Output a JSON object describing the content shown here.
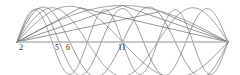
{
  "figure": {
    "title": "",
    "background_color": "#ffffff",
    "width": 240,
    "height": 75
  },
  "axis": {
    "name": "horizontal-axis",
    "color": "#c8c8c8",
    "stroke_width": 1.2,
    "x_start": 17,
    "x_end": 228,
    "y": 42
  },
  "labels": [
    {
      "id": "label-2",
      "text": "2",
      "x": 19,
      "y": 44
    },
    {
      "id": "label-5",
      "text": "5",
      "x": 55,
      "y": 44
    },
    {
      "id": "label-6",
      "text": "6",
      "x": 66,
      "y": 44
    },
    {
      "id": "label-11",
      "text": "11",
      "x": 118,
      "y": 44
    }
  ],
  "chart_data": {
    "type": "line",
    "title": "",
    "xlabel": "",
    "ylabel": "",
    "xlim": [
      0,
      1
    ],
    "ylim": [
      -1,
      1
    ],
    "grid": false,
    "legend": false,
    "axis_line": "horizontal zero axis, light gray",
    "x_samples": 400,
    "series": [
      {
        "name": "mode-1",
        "mode": 1,
        "amplitude": 0.96,
        "phase": 0.0,
        "color": "#6e6e6e",
        "stroke_width": 0.7
      },
      {
        "name": "mode-2",
        "mode": 2,
        "amplitude": 0.94,
        "phase": 0.0,
        "color": "#6a6a6a",
        "stroke_width": 0.7
      },
      {
        "name": "mode-3",
        "mode": 3,
        "amplitude": 0.9,
        "phase": 0.0,
        "color": "#707070",
        "stroke_width": 0.7
      },
      {
        "name": "mode-4",
        "mode": 4,
        "amplitude": 0.92,
        "phase": 0.0,
        "color": "#656565",
        "stroke_width": 0.7
      },
      {
        "name": "mode-5",
        "mode": 5,
        "amplitude": 0.88,
        "phase": 0.0,
        "color": "#6c6c6c",
        "stroke_width": 0.7
      },
      {
        "name": "mode-6",
        "mode": 6,
        "amplitude": 0.85,
        "phase": 0.0,
        "color": "#757575",
        "stroke_width": 0.7
      },
      {
        "name": "chord-1",
        "mode": 0,
        "amplitude": 0.0,
        "phase": 0.0,
        "color": "#6a6a6a",
        "stroke_width": 0.7,
        "polyline": [
          [
            0,
            0
          ],
          [
            0.3,
            0.9
          ],
          [
            1.0,
            0.0
          ]
        ]
      },
      {
        "name": "chord-2",
        "mode": 0,
        "amplitude": 0.0,
        "phase": 0.0,
        "color": "#6a6a6a",
        "stroke_width": 0.7,
        "polyline": [
          [
            0,
            0
          ],
          [
            0.5,
            0.96
          ],
          [
            1.0,
            0.0
          ]
        ]
      },
      {
        "name": "chord-3",
        "mode": 0,
        "amplitude": 0.0,
        "phase": 0.0,
        "color": "#6a6a6a",
        "stroke_width": 0.7,
        "polyline": [
          [
            0,
            0
          ],
          [
            0.68,
            0.8
          ],
          [
            1.0,
            0.0
          ]
        ]
      },
      {
        "name": "chord-4",
        "mode": 0,
        "amplitude": 0.0,
        "phase": 0.0,
        "color": "#6a6a6a",
        "stroke_width": 0.7,
        "polyline": [
          [
            0,
            0
          ],
          [
            1.0,
            0.0
          ]
        ]
      }
    ],
    "annotated_modes": [
      2,
      5,
      6,
      11
    ]
  }
}
